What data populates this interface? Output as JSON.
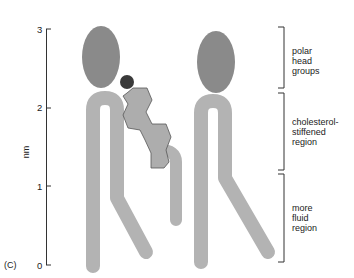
{
  "figure": {
    "panel_label": "(C)",
    "axis": {
      "unit_label": "nm",
      "ticks": [
        "0",
        "1",
        "2",
        "3"
      ]
    },
    "regions": [
      {
        "line1": "polar",
        "line2": "head",
        "line3": "groups"
      },
      {
        "line1": "cholesterol-",
        "line2": "stiffened",
        "line3": "region"
      },
      {
        "line1": "more",
        "line2": "fluid",
        "line3": "region"
      }
    ],
    "colors": {
      "head_group": "#8a8a8a",
      "lipid_tail": "#b3b3b3",
      "cholesterol_ring": "#adadad",
      "cholesterol_oh": "#3a3a3a",
      "axis": "#333333"
    }
  }
}
